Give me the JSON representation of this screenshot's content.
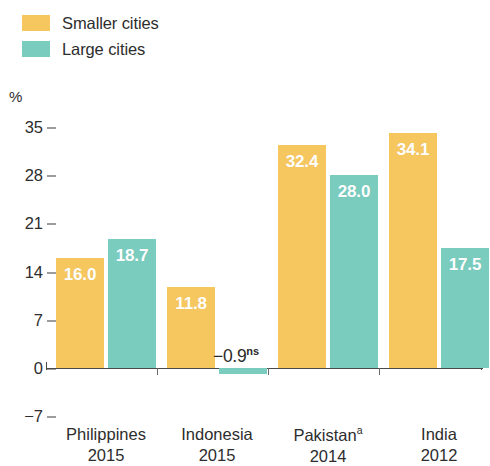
{
  "legend": {
    "items": [
      {
        "label": "Smaller cities",
        "color": "#F7C75F",
        "swatch_name": "legend-swatch-smaller-cities"
      },
      {
        "label": "Large cities",
        "color": "#7ACCBF",
        "swatch_name": "legend-swatch-large-cities"
      }
    ]
  },
  "axis": {
    "unit_label": "%",
    "ticks": [
      "35",
      "28",
      "21",
      "14",
      "7",
      "0",
      "−7"
    ]
  },
  "categories": [
    {
      "name": "Philippines",
      "year": "2015",
      "note": ""
    },
    {
      "name": "Indonesia",
      "year": "2015",
      "note": ""
    },
    {
      "name": "Pakistan",
      "year": "2014",
      "note": "a"
    },
    {
      "name": "India",
      "year": "2012",
      "note": ""
    }
  ],
  "bars": [
    {
      "label": "16.0",
      "value": 16.0,
      "series": "Smaller cities",
      "negative": false
    },
    {
      "label": "18.7",
      "value": 18.7,
      "series": "Large cities",
      "negative": false
    },
    {
      "label": "11.8",
      "value": 11.8,
      "series": "Smaller cities",
      "negative": false
    },
    {
      "label": "−0.9",
      "suffix": "ns",
      "value": -0.9,
      "series": "Large cities",
      "negative": true
    },
    {
      "label": "32.4",
      "value": 32.4,
      "series": "Smaller cities",
      "negative": false
    },
    {
      "label": "28.0",
      "value": 28.0,
      "series": "Large cities",
      "negative": false
    },
    {
      "label": "34.1",
      "value": 34.1,
      "series": "Smaller cities",
      "negative": false
    },
    {
      "label": "17.5",
      "value": 17.5,
      "series": "Large cities",
      "negative": false
    }
  ],
  "chart_data": {
    "type": "bar",
    "title": "",
    "subtitle": "",
    "xlabel": "",
    "ylabel": "%",
    "ylim": [
      -7,
      35
    ],
    "yticks": [
      -7,
      0,
      7,
      14,
      21,
      28,
      35
    ],
    "grid": false,
    "legend_position": "top-left",
    "categories": [
      "Philippines 2015",
      "Indonesia 2015",
      "Pakistanᵃ 2014",
      "India 2012"
    ],
    "series": [
      {
        "name": "Smaller cities",
        "color": "#F7C75F",
        "values": [
          16.0,
          11.8,
          32.4,
          34.1
        ]
      },
      {
        "name": "Large cities",
        "color": "#7ACCBF",
        "values": [
          18.7,
          -0.9,
          28.0,
          17.5
        ]
      }
    ],
    "annotations": [
      {
        "text": "−0.9ns",
        "series": "Large cities",
        "category": "Indonesia 2015",
        "note": "ns = not significant"
      },
      {
        "text": "Pakistanᵃ",
        "note": "superscript a footnote marker on category label"
      }
    ],
    "data_labels": [
      "16.0",
      "18.7",
      "11.8",
      "−0.9ns",
      "32.4",
      "28.0",
      "34.1",
      "17.5"
    ]
  },
  "colors": {
    "smaller_cities": "#F7C75F",
    "large_cities": "#7ACCBF",
    "axis": "#4a4a4a",
    "text": "#2d2d2d",
    "background": "#ffffff"
  }
}
